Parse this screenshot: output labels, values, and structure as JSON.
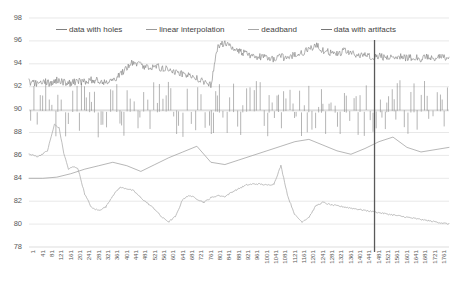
{
  "chart_data": {
    "type": "line",
    "title": "",
    "xlabel": "",
    "ylabel": "",
    "ylim": [
      78,
      98
    ],
    "yticks": [
      78,
      80,
      82,
      84,
      86,
      88,
      90,
      92,
      94,
      96,
      98
    ],
    "grid": true,
    "legend_position": "top",
    "xlim": [
      1,
      1800
    ],
    "marker_line_x": 1481,
    "xticks": [
      1,
      41,
      81,
      121,
      161,
      201,
      241,
      281,
      321,
      361,
      401,
      441,
      481,
      521,
      561,
      601,
      641,
      681,
      721,
      761,
      801,
      841,
      881,
      921,
      961,
      1001,
      1041,
      1081,
      1121,
      1161,
      1201,
      1241,
      1281,
      1321,
      1361,
      1401,
      1441,
      1481,
      1521,
      1561,
      1601,
      1641,
      1681,
      1721,
      1761
    ],
    "series": [
      {
        "name": "data with holes",
        "color": "#808080",
        "x": [
          1,
          30,
          60,
          90,
          120,
          150,
          180,
          210,
          240,
          270,
          300,
          330,
          360,
          390,
          420,
          450,
          480,
          510,
          540,
          570,
          600,
          630,
          660,
          690,
          720,
          750,
          780,
          810,
          840,
          870,
          900,
          930,
          960,
          990,
          1020,
          1050,
          1080,
          1110,
          1140,
          1170,
          1200,
          1230,
          1260,
          1290,
          1320,
          1350,
          1380,
          1410,
          1440,
          1470,
          1500,
          1530,
          1560,
          1590,
          1620,
          1650,
          1680,
          1710,
          1740,
          1770,
          1800
        ],
        "values": [
          92.4,
          92.3,
          92.5,
          92.3,
          92.6,
          92.4,
          92.3,
          92.5,
          92.4,
          92.6,
          92.5,
          92.4,
          92.6,
          93.0,
          93.6,
          94.2,
          93.9,
          93.7,
          93.8,
          93.6,
          93.5,
          93.3,
          93.1,
          92.9,
          92.7,
          92.4,
          92.1,
          95.6,
          95.8,
          95.4,
          95.1,
          94.9,
          94.7,
          94.6,
          94.5,
          94.4,
          94.6,
          94.5,
          94.8,
          94.9,
          95.3,
          95.6,
          95.2,
          95.0,
          94.9,
          95.1,
          94.9,
          94.7,
          94.8,
          94.6,
          94.7,
          94.5,
          94.6,
          94.7,
          94.5,
          94.6,
          94.4,
          94.6,
          94.5,
          94.6,
          94.4
        ]
      },
      {
        "name": "linear interpolation",
        "color": "#9a9a9a",
        "x": [
          1,
          60,
          120,
          180,
          240,
          300,
          360,
          420,
          480,
          540,
          600,
          660,
          720,
          780,
          840,
          900,
          960,
          1020,
          1080,
          1140,
          1200,
          1260,
          1320,
          1380,
          1440,
          1500,
          1560,
          1620,
          1680,
          1740,
          1800
        ],
        "values": [
          84.0,
          84.0,
          84.1,
          84.4,
          84.8,
          85.1,
          85.4,
          85.1,
          84.6,
          85.2,
          85.8,
          86.3,
          86.8,
          85.4,
          85.2,
          85.6,
          86.0,
          86.4,
          86.8,
          87.2,
          87.4,
          86.9,
          86.4,
          86.1,
          86.6,
          87.2,
          87.6,
          86.7,
          86.3,
          86.5,
          86.7
        ]
      },
      {
        "name": "deadband",
        "color": "#a6a6a6",
        "x": [
          1,
          40,
          80,
          110,
          130,
          150,
          170,
          190,
          210,
          240,
          270,
          300,
          330,
          360,
          390,
          420,
          450,
          480,
          510,
          540,
          570,
          600,
          630,
          660,
          690,
          720,
          750,
          780,
          810,
          840,
          870,
          900,
          930,
          960,
          990,
          1020,
          1050,
          1080,
          1110,
          1140,
          1170,
          1200,
          1230,
          1260,
          1290,
          1320,
          1350,
          1380,
          1410,
          1440,
          1470,
          1500,
          1530,
          1560,
          1590,
          1620,
          1650,
          1680,
          1710,
          1740,
          1770,
          1800
        ],
        "values": [
          86.1,
          85.9,
          86.4,
          88.7,
          88.4,
          86.2,
          84.8,
          85.0,
          84.9,
          82.6,
          81.4,
          81.2,
          81.5,
          82.5,
          83.2,
          83.1,
          82.9,
          82.3,
          81.8,
          81.3,
          80.6,
          80.2,
          80.7,
          82.2,
          82.5,
          82.2,
          81.9,
          82.3,
          82.5,
          82.4,
          82.8,
          83.1,
          83.4,
          83.5,
          83.5,
          83.4,
          83.5,
          85.1,
          82.4,
          80.8,
          80.2,
          80.6,
          81.6,
          81.9,
          81.7,
          81.6,
          81.5,
          81.4,
          81.3,
          81.2,
          81.1,
          81.0,
          80.9,
          80.8,
          80.7,
          80.6,
          80.5,
          80.4,
          80.3,
          80.2,
          80.1,
          80.0
        ]
      },
      {
        "name": "data with artifacts",
        "color": "#767676",
        "x": [
          1,
          1800
        ],
        "values": [
          90.0,
          90.0
        ],
        "note": "dense spike band centered at 90"
      }
    ]
  },
  "legend": {
    "items": [
      {
        "label": "data with holes",
        "color": "#808080"
      },
      {
        "label": "linear interpolation",
        "color": "#9a9a9a"
      },
      {
        "label": "deadband",
        "color": "#a6a6a6"
      },
      {
        "label": "data with artifacts",
        "color": "#767676"
      }
    ]
  },
  "axis": {
    "y_tick_labels": [
      "98",
      "96",
      "94",
      "92",
      "90",
      "88",
      "86",
      "84",
      "82",
      "80",
      "78"
    ],
    "x_tick_labels": [
      "1",
      "41",
      "81",
      "121",
      "161",
      "201",
      "241",
      "281",
      "321",
      "361",
      "401",
      "441",
      "481",
      "521",
      "561",
      "601",
      "641",
      "681",
      "721",
      "761",
      "801",
      "841",
      "881",
      "921",
      "961",
      "1001",
      "1041",
      "1081",
      "1121",
      "1161",
      "1201",
      "1241",
      "1281",
      "1321",
      "1361",
      "1401",
      "1441",
      "1481",
      "1521",
      "1561",
      "1601",
      "1641",
      "1681",
      "1721",
      "1761"
    ]
  }
}
